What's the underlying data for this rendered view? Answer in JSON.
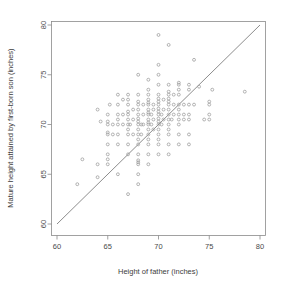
{
  "chart_data": {
    "type": "scatter",
    "title": "",
    "xlabel": "Height of father (inches)",
    "ylabel": "Mature height attained by first-born son (inches)",
    "xlim": [
      58.5,
      81.5
    ],
    "ylim": [
      58.5,
      81.5
    ],
    "xticks": [
      60,
      65,
      70,
      75,
      80
    ],
    "yticks": [
      60,
      65,
      70,
      75,
      80
    ],
    "xtick_labels": [
      "60",
      "65",
      "70",
      "75",
      "80"
    ],
    "ytick_labels": [
      "60",
      "65",
      "70",
      "75",
      "80"
    ],
    "grid": false,
    "legend": "none",
    "point_color": "#9a9a9a",
    "point_marker": "open-circle",
    "line_color": "#6f6f6f",
    "reference_line": {
      "name": "identity-line",
      "description": "y = x diagonal reference line",
      "x0": 60,
      "y0": 60,
      "x1": 80,
      "y1": 80
    },
    "points": [
      [
        62.0,
        64.0
      ],
      [
        62.5,
        66.5
      ],
      [
        64.0,
        64.7
      ],
      [
        64.0,
        66.0
      ],
      [
        64.0,
        71.5
      ],
      [
        64.3,
        70.3
      ],
      [
        65.0,
        66.0
      ],
      [
        65.0,
        66.5
      ],
      [
        65.0,
        67.0
      ],
      [
        65.0,
        68.0
      ],
      [
        65.0,
        69.0
      ],
      [
        65.0,
        69.2
      ],
      [
        65.0,
        70.0
      ],
      [
        65.0,
        70.3
      ],
      [
        65.0,
        71.0
      ],
      [
        65.2,
        72.0
      ],
      [
        65.5,
        69.0
      ],
      [
        65.5,
        70.0
      ],
      [
        66.0,
        65.0
      ],
      [
        66.0,
        68.0
      ],
      [
        66.0,
        69.0
      ],
      [
        66.0,
        70.0
      ],
      [
        66.0,
        70.5
      ],
      [
        66.0,
        71.0
      ],
      [
        66.0,
        72.0
      ],
      [
        66.0,
        73.0
      ],
      [
        66.5,
        70.0
      ],
      [
        66.5,
        71.0
      ],
      [
        66.5,
        72.5
      ],
      [
        67.0,
        63.0
      ],
      [
        67.0,
        67.0
      ],
      [
        67.0,
        68.0
      ],
      [
        67.0,
        69.0
      ],
      [
        67.0,
        69.5
      ],
      [
        67.0,
        70.0
      ],
      [
        67.0,
        70.5
      ],
      [
        67.0,
        71.0
      ],
      [
        67.0,
        71.3
      ],
      [
        67.0,
        72.0
      ],
      [
        67.0,
        72.5
      ],
      [
        67.0,
        73.0
      ],
      [
        67.2,
        70.0
      ],
      [
        67.5,
        69.0
      ],
      [
        67.5,
        70.5
      ],
      [
        67.5,
        71.5
      ],
      [
        68.0,
        64.0
      ],
      [
        68.0,
        65.0
      ],
      [
        68.0,
        66.0
      ],
      [
        68.0,
        66.2
      ],
      [
        68.0,
        66.4
      ],
      [
        68.0,
        67.0
      ],
      [
        68.0,
        68.0
      ],
      [
        68.0,
        68.5
      ],
      [
        68.0,
        69.0
      ],
      [
        68.0,
        69.5
      ],
      [
        68.0,
        70.0
      ],
      [
        68.0,
        70.3
      ],
      [
        68.0,
        70.6
      ],
      [
        68.0,
        71.0
      ],
      [
        68.0,
        71.5
      ],
      [
        68.0,
        72.0
      ],
      [
        68.0,
        72.3
      ],
      [
        68.0,
        73.0
      ],
      [
        68.0,
        75.0
      ],
      [
        68.3,
        69.0
      ],
      [
        68.3,
        70.0
      ],
      [
        68.5,
        70.0
      ],
      [
        68.5,
        71.0
      ],
      [
        68.5,
        72.0
      ],
      [
        69.0,
        66.0
      ],
      [
        69.0,
        67.0
      ],
      [
        69.0,
        68.0
      ],
      [
        69.0,
        68.5
      ],
      [
        69.0,
        69.0
      ],
      [
        69.0,
        69.5
      ],
      [
        69.0,
        70.0
      ],
      [
        69.0,
        70.2
      ],
      [
        69.0,
        70.5
      ],
      [
        69.0,
        71.0
      ],
      [
        69.0,
        71.2
      ],
      [
        69.0,
        71.5
      ],
      [
        69.0,
        72.0
      ],
      [
        69.0,
        72.2
      ],
      [
        69.0,
        72.5
      ],
      [
        69.0,
        73.0
      ],
      [
        69.0,
        73.5
      ],
      [
        69.0,
        74.5
      ],
      [
        69.3,
        70.0
      ],
      [
        69.3,
        71.0
      ],
      [
        69.5,
        69.5
      ],
      [
        69.5,
        70.5
      ],
      [
        69.5,
        71.5
      ],
      [
        69.5,
        72.0
      ],
      [
        70.0,
        67.0
      ],
      [
        70.0,
        68.0
      ],
      [
        70.0,
        68.5
      ],
      [
        70.0,
        69.0
      ],
      [
        70.0,
        69.5
      ],
      [
        70.0,
        70.0
      ],
      [
        70.0,
        70.3
      ],
      [
        70.0,
        70.6
      ],
      [
        70.0,
        71.0
      ],
      [
        70.0,
        71.3
      ],
      [
        70.0,
        71.6
      ],
      [
        70.0,
        72.0
      ],
      [
        70.0,
        72.3
      ],
      [
        70.0,
        72.6
      ],
      [
        70.0,
        73.0
      ],
      [
        70.0,
        74.0
      ],
      [
        70.0,
        75.0
      ],
      [
        70.0,
        76.0
      ],
      [
        70.0,
        79.0
      ],
      [
        70.3,
        70.0
      ],
      [
        70.3,
        71.0
      ],
      [
        70.5,
        70.5
      ],
      [
        70.5,
        71.5
      ],
      [
        70.5,
        72.5
      ],
      [
        71.0,
        67.0
      ],
      [
        71.0,
        68.0
      ],
      [
        71.0,
        69.0
      ],
      [
        71.0,
        69.5
      ],
      [
        71.0,
        70.0
      ],
      [
        71.0,
        70.5
      ],
      [
        71.0,
        71.0
      ],
      [
        71.0,
        71.5
      ],
      [
        71.0,
        72.0
      ],
      [
        71.0,
        72.3
      ],
      [
        71.0,
        72.6
      ],
      [
        71.0,
        73.0
      ],
      [
        71.0,
        73.3
      ],
      [
        71.0,
        74.0
      ],
      [
        71.0,
        78.0
      ],
      [
        71.3,
        70.5
      ],
      [
        71.5,
        71.0
      ],
      [
        71.5,
        72.0
      ],
      [
        71.5,
        73.0
      ],
      [
        72.0,
        68.0
      ],
      [
        72.0,
        69.0
      ],
      [
        72.0,
        70.0
      ],
      [
        72.0,
        70.5
      ],
      [
        72.0,
        71.0
      ],
      [
        72.0,
        71.5
      ],
      [
        72.0,
        72.0
      ],
      [
        72.0,
        73.0
      ],
      [
        72.0,
        73.5
      ],
      [
        72.0,
        74.0
      ],
      [
        72.0,
        74.2
      ],
      [
        72.5,
        70.5
      ],
      [
        72.5,
        71.0
      ],
      [
        72.5,
        72.0
      ],
      [
        73.0,
        68.0
      ],
      [
        73.0,
        69.0
      ],
      [
        73.0,
        70.5
      ],
      [
        73.0,
        71.0
      ],
      [
        73.0,
        72.0
      ],
      [
        73.0,
        73.5
      ],
      [
        73.0,
        74.0
      ],
      [
        73.5,
        72.0
      ],
      [
        73.5,
        76.5
      ],
      [
        74.0,
        73.8
      ],
      [
        74.5,
        70.5
      ],
      [
        75.0,
        70.5
      ],
      [
        75.0,
        71.0
      ],
      [
        75.0,
        72.0
      ],
      [
        75.0,
        72.3
      ],
      [
        75.3,
        73.5
      ],
      [
        78.5,
        73.3
      ]
    ]
  }
}
